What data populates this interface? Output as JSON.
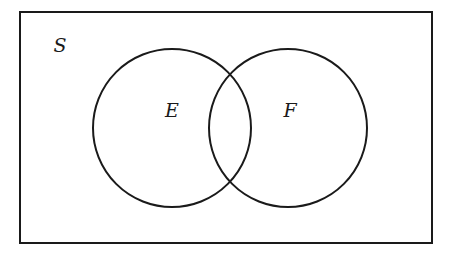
{
  "diagram": {
    "type": "venn",
    "stroke_color": "#1a1a1a",
    "background": "#ffffff",
    "universe": {
      "label": "S",
      "x": 20,
      "y": 12,
      "width": 412,
      "height": 231
    },
    "sets": [
      {
        "label": "E",
        "cx": 172,
        "cy": 128,
        "r": 79,
        "label_x": 172,
        "label_y": 117
      },
      {
        "label": "F",
        "cx": 288,
        "cy": 128,
        "r": 79,
        "label_x": 290,
        "label_y": 117
      }
    ],
    "universe_label_pos": {
      "x": 60,
      "y": 52
    }
  }
}
